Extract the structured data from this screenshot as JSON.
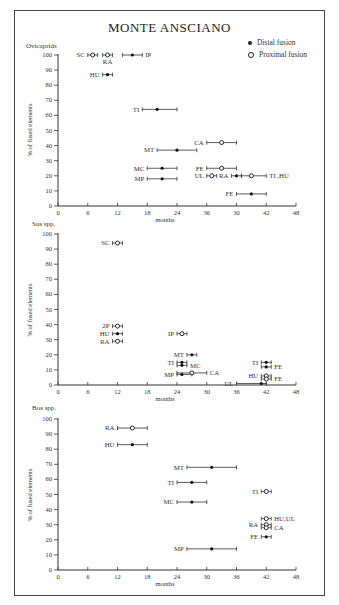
{
  "figure": {
    "title": "MONTE ANSCIANO",
    "legend": [
      {
        "marker": "filled-dot",
        "label": "Distal fusion"
      },
      {
        "marker": "open-circle",
        "label": "Proximal fusion"
      }
    ]
  },
  "chart_data": [
    {
      "type": "scatter",
      "panel": "Ovicaprids",
      "title": "Ovicaprids",
      "xlabel": "months",
      "ylabel": "% of fused elements",
      "xlim": [
        0,
        48
      ],
      "ylim": [
        0,
        100
      ],
      "x_tick_labels": [
        "0",
        "6",
        "12",
        "18",
        "24",
        "36",
        "30",
        "42",
        "48"
      ],
      "y_tick_labels": [
        "0",
        "10",
        "20",
        "30",
        "40",
        "50",
        "60",
        "70",
        "80",
        "90",
        "100"
      ],
      "points": [
        {
          "label": "SC",
          "fusion": "proximal",
          "x": 7,
          "x_min": 6,
          "x_max": 8,
          "y": 100,
          "label_side": "left"
        },
        {
          "label": "RA",
          "fusion": "proximal",
          "x": 10,
          "x_min": 9,
          "x_max": 11,
          "y": 100,
          "label_side": "below"
        },
        {
          "label": "IP",
          "fusion": "distal",
          "x": 15,
          "x_min": 13,
          "x_max": 17,
          "y": 100,
          "label_side": "right"
        },
        {
          "label": "HU",
          "fusion": "distal",
          "x": 10,
          "x_min": 9,
          "x_max": 11,
          "y": 87,
          "label_side": "left"
        },
        {
          "label": "TI",
          "fusion": "distal",
          "x": 20,
          "x_min": 17,
          "x_max": 24,
          "y": 64,
          "label_side": "left"
        },
        {
          "label": "CA",
          "fusion": "proximal",
          "x": 33,
          "x_min": 30,
          "x_max": 36,
          "y": 42,
          "label_side": "left"
        },
        {
          "label": "MT",
          "fusion": "distal",
          "x": 24,
          "x_min": 20,
          "x_max": 28,
          "y": 37,
          "label_side": "left"
        },
        {
          "label": "MC",
          "fusion": "distal",
          "x": 21,
          "x_min": 18,
          "x_max": 24,
          "y": 25,
          "label_side": "left"
        },
        {
          "label": "FE",
          "fusion": "proximal",
          "x": 33,
          "x_min": 30,
          "x_max": 36,
          "y": 25,
          "label_side": "left"
        },
        {
          "label": "MP",
          "fusion": "distal",
          "x": 21,
          "x_min": 18,
          "x_max": 24,
          "y": 18,
          "label_side": "left"
        },
        {
          "label": "UL",
          "fusion": "proximal",
          "x": 31,
          "x_min": 30,
          "x_max": 32,
          "y": 20,
          "label_side": "left"
        },
        {
          "label": "RA",
          "fusion": "distal",
          "x": 36,
          "x_min": 35,
          "x_max": 37,
          "y": 20,
          "label_side": "left"
        },
        {
          "label": "TI ,HU",
          "fusion": "proximal",
          "x": 39,
          "x_min": 37,
          "x_max": 42,
          "y": 20,
          "label_side": "right"
        },
        {
          "label": "FE",
          "fusion": "distal",
          "x": 39,
          "x_min": 36,
          "x_max": 42,
          "y": 8,
          "label_side": "left"
        }
      ]
    },
    {
      "type": "scatter",
      "panel": "Sus spp.",
      "title": "Sus spp.",
      "xlabel": "months",
      "ylabel": "% of fused elements",
      "xlim": [
        0,
        48
      ],
      "ylim": [
        0,
        100
      ],
      "x_tick_labels": [
        "0",
        "6",
        "12",
        "18",
        "24",
        "30",
        "36",
        "42",
        "48"
      ],
      "y_tick_labels": [
        "0",
        "10",
        "20",
        "30",
        "40",
        "50",
        "60",
        "70",
        "80",
        "90",
        "100"
      ],
      "points": [
        {
          "label": "SC",
          "fusion": "proximal",
          "x": 12,
          "x_min": 11,
          "x_max": 13,
          "y": 94,
          "label_side": "left"
        },
        {
          "label": "2P",
          "fusion": "proximal",
          "x": 12,
          "x_min": 11,
          "x_max": 13,
          "y": 39,
          "label_side": "left"
        },
        {
          "label": "HU",
          "fusion": "distal",
          "x": 12,
          "x_min": 11,
          "x_max": 13,
          "y": 34,
          "label_side": "left"
        },
        {
          "label": "RA",
          "fusion": "proximal",
          "x": 12,
          "x_min": 11,
          "x_max": 13,
          "y": 29,
          "label_side": "left"
        },
        {
          "label": "IP",
          "fusion": "proximal",
          "x": 25,
          "x_min": 24,
          "x_max": 26,
          "y": 34,
          "label_side": "left"
        },
        {
          "label": "MT",
          "fusion": "distal",
          "x": 27,
          "x_min": 26,
          "x_max": 28,
          "y": 20,
          "label_side": "left"
        },
        {
          "label": "TI",
          "fusion": "distal",
          "x": 25,
          "x_min": 24,
          "x_max": 26,
          "y": 15,
          "label_side": "left"
        },
        {
          "label": "MC",
          "fusion": "distal",
          "x": 25,
          "x_min": 24,
          "x_max": 26,
          "y": 13,
          "label_side": "right"
        },
        {
          "label": "MP",
          "fusion": "distal",
          "x": 25,
          "x_min": 24,
          "x_max": 27,
          "y": 7,
          "label_side": "left"
        },
        {
          "label": "CA",
          "fusion": "proximal",
          "x": 27,
          "x_min": 24,
          "x_max": 30,
          "y": 8,
          "label_side": "right"
        },
        {
          "label": "TI",
          "fusion": "distal",
          "x": 42,
          "x_min": 41,
          "x_max": 43,
          "y": 15,
          "label_side": "left"
        },
        {
          "label": "FE",
          "fusion": "distal",
          "x": 42,
          "x_min": 41,
          "x_max": 43,
          "y": 12,
          "label_side": "right"
        },
        {
          "label": "HU",
          "fusion": "proximal",
          "x": 42,
          "x_min": 41,
          "x_max": 43,
          "y": 6,
          "label_side": "left"
        },
        {
          "label": "FE",
          "fusion": "proximal",
          "x": 42,
          "x_min": 41,
          "x_max": 43,
          "y": 4,
          "label_side": "right"
        },
        {
          "label": "UL",
          "fusion": "distal",
          "x": 41,
          "x_min": 36,
          "x_max": 42,
          "y": 1,
          "label_side": "left"
        }
      ]
    },
    {
      "type": "scatter",
      "panel": "Bos spp.",
      "title": "Bos spp.",
      "xlabel": "months",
      "ylabel": "% of fused elements",
      "xlim": [
        0,
        48
      ],
      "ylim": [
        0,
        100
      ],
      "x_tick_labels": [
        "0",
        "6",
        "12",
        "18",
        "24",
        "30",
        "36",
        "42",
        "48"
      ],
      "y_tick_labels": [
        "0",
        "10",
        "20",
        "30",
        "40",
        "50",
        "60",
        "70",
        "80",
        "90",
        "100"
      ],
      "points": [
        {
          "label": "RA",
          "fusion": "proximal",
          "x": 15,
          "x_min": 12,
          "x_max": 18,
          "y": 94,
          "label_side": "left"
        },
        {
          "label": "HU",
          "fusion": "distal",
          "x": 15,
          "x_min": 12,
          "x_max": 18,
          "y": 83,
          "label_side": "left"
        },
        {
          "label": "MT",
          "fusion": "distal",
          "x": 31,
          "x_min": 26,
          "x_max": 36,
          "y": 68,
          "label_side": "left"
        },
        {
          "label": "TI",
          "fusion": "distal",
          "x": 27,
          "x_min": 24,
          "x_max": 30,
          "y": 58,
          "label_side": "left"
        },
        {
          "label": "TI",
          "fusion": "proximal",
          "x": 42,
          "x_min": 41,
          "x_max": 43,
          "y": 52,
          "label_side": "left"
        },
        {
          "label": "MC",
          "fusion": "distal",
          "x": 27,
          "x_min": 24,
          "x_max": 30,
          "y": 45,
          "label_side": "left"
        },
        {
          "label": "HU,UL",
          "fusion": "proximal",
          "x": 42,
          "x_min": 41,
          "x_max": 43,
          "y": 34,
          "label_side": "right"
        },
        {
          "label": "RA",
          "fusion": "proximal",
          "x": 42,
          "x_min": 41,
          "x_max": 43,
          "y": 30,
          "label_side": "left"
        },
        {
          "label": "CA",
          "fusion": "proximal",
          "x": 42,
          "x_min": 41,
          "x_max": 43,
          "y": 28,
          "label_side": "right"
        },
        {
          "label": "FE",
          "fusion": "distal",
          "x": 42,
          "x_min": 41,
          "x_max": 43,
          "y": 22,
          "label_side": "left"
        },
        {
          "label": "MP",
          "fusion": "distal",
          "x": 31,
          "x_min": 26,
          "x_max": 36,
          "y": 14,
          "label_side": "left"
        }
      ]
    }
  ],
  "layout": {
    "panels": [
      {
        "x0": 58,
        "x1": 296,
        "y0": 206,
        "y1": 55,
        "title_x": 26,
        "title_y": 48,
        "ylabel_x": 32,
        "ylabel_y": 130
      },
      {
        "x0": 58,
        "x1": 296,
        "y0": 385,
        "y1": 234,
        "title_x": 32,
        "title_y": 226,
        "ylabel_x": 32,
        "ylabel_y": 310
      },
      {
        "x0": 58,
        "x1": 296,
        "y0": 570,
        "y1": 419,
        "title_x": 32,
        "title_y": 410,
        "ylabel_x": 32,
        "ylabel_y": 495
      }
    ]
  }
}
